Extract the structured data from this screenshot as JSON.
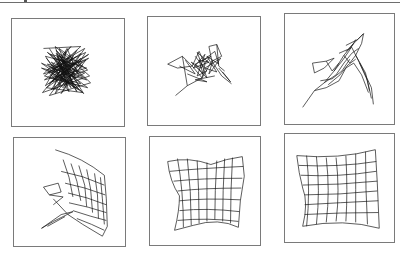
{
  "figure": {
    "line_color": "#111111",
    "frame_color": "#7a7a7a",
    "panels": [
      {
        "index": 1,
        "stage": "random-tangle",
        "box": [
          11,
          18,
          114,
          109
        ]
      },
      {
        "index": 2,
        "stage": "partially-clustered",
        "box": [
          147,
          16,
          114,
          110
        ]
      },
      {
        "index": 3,
        "stage": "folding",
        "box": [
          284,
          13,
          111,
          112
        ]
      },
      {
        "index": 4,
        "stage": "partially-unfolded-grid",
        "box": [
          13,
          137,
          113,
          110
        ]
      },
      {
        "index": 5,
        "stage": "unfolded-warped-grid",
        "box": [
          149,
          136,
          112,
          110
        ]
      },
      {
        "index": 6,
        "stage": "near-regular-grid",
        "box": [
          284,
          133,
          111,
          110
        ]
      }
    ]
  }
}
